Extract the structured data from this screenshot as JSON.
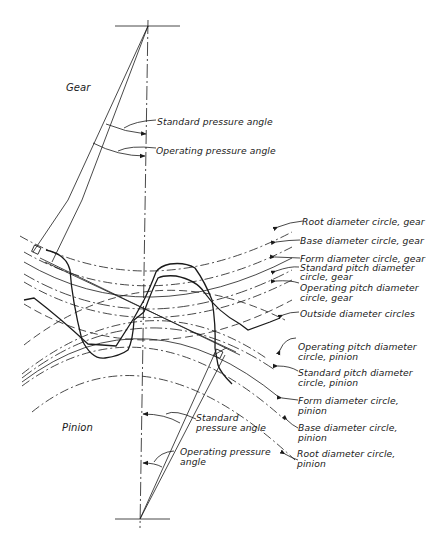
{
  "figure": {
    "type": "gear-mesh-diagram",
    "regions": {
      "gear_label": "Gear",
      "pinion_label": "Pinion"
    },
    "gear_angles": {
      "standard_pressure_angle": "Standard pressure angle",
      "operating_pressure_angle": "Operating pressure angle"
    },
    "pinion_angles": {
      "standard_pressure_angle_line1": "Standard",
      "standard_pressure_angle_line2": "pressure angle",
      "operating_pressure_angle_line1": "Operating pressure",
      "operating_pressure_angle_line2": "angle"
    },
    "callouts": [
      {
        "line1": "Root diameter circle, gear",
        "line2": ""
      },
      {
        "line1": "Base diameter circle, gear",
        "line2": ""
      },
      {
        "line1": "Form diameter circle, gear",
        "line2": ""
      },
      {
        "line1": "Standard pitch diameter",
        "line2": "circle, gear"
      },
      {
        "line1": "Operating pitch diameter",
        "line2": "circle, gear"
      },
      {
        "line1": "Outside diameter circles",
        "line2": ""
      },
      {
        "line1": "Operating pitch diameter",
        "line2": "circle, pinion"
      },
      {
        "line1": "Standard pitch diameter",
        "line2": "circle, pinion"
      },
      {
        "line1": "Form diameter circle,",
        "line2": "pinion"
      },
      {
        "line1": "Base diameter circle,",
        "line2": "pinion"
      },
      {
        "line1": "Root diameter circle,",
        "line2": "pinion"
      }
    ],
    "colors": {
      "line": "#1a1a1a",
      "background": "#ffffff"
    }
  }
}
